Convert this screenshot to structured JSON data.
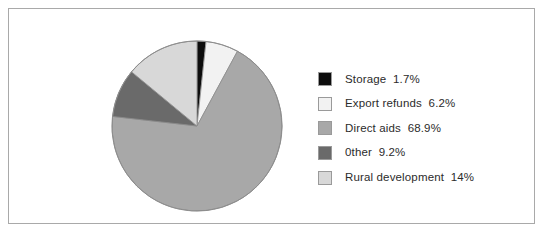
{
  "frame": {
    "border_color": "#a9a9a9",
    "background": "#ffffff"
  },
  "chart_data": {
    "type": "pie",
    "title": "",
    "subtitle": "",
    "xlabel": "",
    "ylabel": "",
    "grid": false,
    "legend_position": "right",
    "start_angle_deg": 0,
    "direction": "clockwise",
    "categories": [
      "Storage",
      "Export refunds",
      "Direct aids",
      "0ther",
      "Rural development"
    ],
    "values": [
      1.7,
      6.2,
      68.9,
      9.2,
      14
    ],
    "value_unit": "%",
    "value_labels": [
      "1.7%",
      "6.2%",
      "68.9%",
      "9.2%",
      "14%"
    ],
    "colors": [
      "#0d0d0d",
      "#f2f2f2",
      "#a8a8a8",
      "#6a6a6a",
      "#d8d8d8"
    ],
    "slice_border_color": "#8c8c8c",
    "slices": [
      {
        "name": "Storage",
        "value": 1.7,
        "label": "Storage  1.7%",
        "color": "#0d0d0d"
      },
      {
        "name": "Export refunds",
        "value": 6.2,
        "label": "Export refunds  6.2%",
        "color": "#f2f2f2"
      },
      {
        "name": "Direct aids",
        "value": 68.9,
        "label": "Direct aids  68.9%",
        "color": "#a8a8a8"
      },
      {
        "name": "0ther",
        "value": 9.2,
        "label": "0ther  9.2%",
        "color": "#6a6a6a"
      },
      {
        "name": "Rural development",
        "value": 14,
        "label": "Rural development  14%",
        "color": "#d8d8d8"
      }
    ]
  },
  "legend": {
    "items": [
      {
        "label": "Storage  1.7%",
        "color": "#0d0d0d"
      },
      {
        "label": "Export refunds  6.2%",
        "color": "#f2f2f2"
      },
      {
        "label": "Direct aids  68.9%",
        "color": "#a8a8a8"
      },
      {
        "label": "0ther  9.2%",
        "color": "#6a6a6a"
      },
      {
        "label": "Rural development  14%",
        "color": "#d8d8d8"
      }
    ]
  }
}
